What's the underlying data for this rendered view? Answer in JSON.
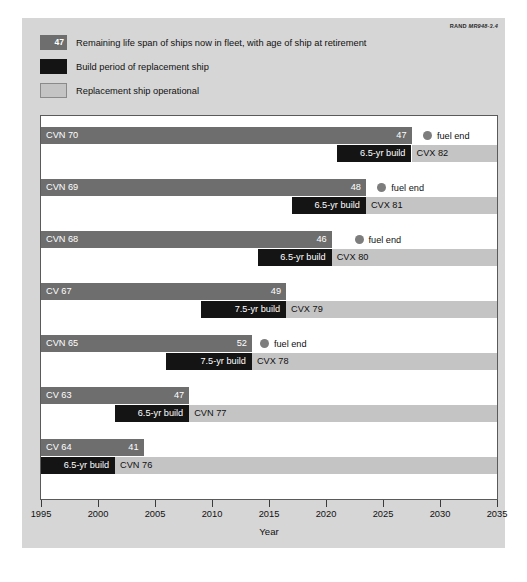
{
  "credit": {
    "org": "RAND",
    "figure_id": "MR948-3.4"
  },
  "legend": {
    "items": [
      {
        "swatch": "remaining",
        "swatch_value": "47",
        "label": "Remaining life span of ships now in fleet, with age of ship at retirement",
        "color": "#6e6e6e"
      },
      {
        "swatch": "build",
        "swatch_value": "",
        "label": "Build period of replacement ship",
        "color": "#141414"
      },
      {
        "swatch": "operational",
        "swatch_value": "",
        "label": "Replacement ship operational",
        "color": "#c4c4c4"
      }
    ]
  },
  "fuel_end_label": "fuel end",
  "chart_data": {
    "type": "bar",
    "title": "",
    "xlabel": "Year",
    "ylabel": "",
    "xlim": [
      1995,
      2035
    ],
    "xticks": [
      1995,
      2000,
      2005,
      2010,
      2015,
      2020,
      2025,
      2030,
      2035
    ],
    "grid": false,
    "legend_position": "above",
    "orientation": "horizontal",
    "categories": [
      "CVN 70",
      "CVN 69",
      "CVN 68",
      "CV 67",
      "CVN 65",
      "CV 63",
      "CV 64"
    ],
    "series": [
      {
        "name": "Remaining life span of ships now in fleet, with age of ship at retirement",
        "color": "#6e6e6e",
        "values": [
          {
            "start": 1995,
            "end": 2027.5
          },
          {
            "start": 1995,
            "end": 2023.5
          },
          {
            "start": 1995,
            "end": 2020.5
          },
          {
            "start": 1995,
            "end": 2016.5
          },
          {
            "start": 1995,
            "end": 2013.5
          },
          {
            "start": 1995,
            "end": 2008.0
          },
          {
            "start": 1995,
            "end": 2004.0
          }
        ]
      },
      {
        "name": "Build period of replacement ship",
        "color": "#141414",
        "values": [
          {
            "start": 2021.0,
            "end": 2027.5
          },
          {
            "start": 2017.0,
            "end": 2023.5
          },
          {
            "start": 2014.0,
            "end": 2020.5
          },
          {
            "start": 2009.0,
            "end": 2016.5
          },
          {
            "start": 2006.0,
            "end": 2013.5
          },
          {
            "start": 2001.5,
            "end": 2008.0
          },
          {
            "start": 1995.0,
            "end": 2001.5
          }
        ]
      },
      {
        "name": "Replacement ship operational",
        "color": "#c4c4c4",
        "values": [
          {
            "start": 2027.5,
            "end": 2035
          },
          {
            "start": 2023.5,
            "end": 2035
          },
          {
            "start": 2020.5,
            "end": 2035
          },
          {
            "start": 2016.5,
            "end": 2035
          },
          {
            "start": 2013.5,
            "end": 2035
          },
          {
            "start": 2008.0,
            "end": 2035
          },
          {
            "start": 2001.5,
            "end": 2035
          }
        ]
      }
    ],
    "rows": [
      {
        "ship": "CVN 70",
        "age_at_retirement": 47,
        "remaining_start": 1995,
        "remaining_end": 2027.5,
        "build_label": "6.5-yr build",
        "build_years": 6.5,
        "build_start": 2021.0,
        "build_end": 2027.5,
        "replacement": "CVX 82",
        "operational_start": 2027.5,
        "operational_end": 2035,
        "fuel_end": true,
        "fuel_end_year": 2028.5
      },
      {
        "ship": "CVN 69",
        "age_at_retirement": 48,
        "remaining_start": 1995,
        "remaining_end": 2023.5,
        "build_label": "6.5-yr build",
        "build_years": 6.5,
        "build_start": 2017.0,
        "build_end": 2023.5,
        "replacement": "CVX 81",
        "operational_start": 2023.5,
        "operational_end": 2035,
        "fuel_end": true,
        "fuel_end_year": 2024.5
      },
      {
        "ship": "CVN 68",
        "age_at_retirement": 46,
        "remaining_start": 1995,
        "remaining_end": 2020.5,
        "build_label": "6.5-yr build",
        "build_years": 6.5,
        "build_start": 2014.0,
        "build_end": 2020.5,
        "replacement": "CVX 80",
        "operational_start": 2020.5,
        "operational_end": 2035,
        "fuel_end": true,
        "fuel_end_year": 2022.5
      },
      {
        "ship": "CV 67",
        "age_at_retirement": 49,
        "remaining_start": 1995,
        "remaining_end": 2016.5,
        "build_label": "7.5-yr build",
        "build_years": 7.5,
        "build_start": 2009.0,
        "build_end": 2016.5,
        "replacement": "CVX 79",
        "operational_start": 2016.5,
        "operational_end": 2035,
        "fuel_end": false,
        "fuel_end_year": null
      },
      {
        "ship": "CVN 65",
        "age_at_retirement": 52,
        "remaining_start": 1995,
        "remaining_end": 2013.5,
        "build_label": "7.5-yr build",
        "build_years": 7.5,
        "build_start": 2006.0,
        "build_end": 2013.5,
        "replacement": "CVX 78",
        "operational_start": 2013.5,
        "operational_end": 2035,
        "fuel_end": true,
        "fuel_end_year": 2014.2
      },
      {
        "ship": "CV 63",
        "age_at_retirement": 47,
        "remaining_start": 1995,
        "remaining_end": 2008.0,
        "build_label": "6.5-yr build",
        "build_years": 6.5,
        "build_start": 2001.5,
        "build_end": 2008.0,
        "replacement": "CVN 77",
        "operational_start": 2008.0,
        "operational_end": 2035,
        "fuel_end": false,
        "fuel_end_year": null
      },
      {
        "ship": "CV 64",
        "age_at_retirement": 41,
        "remaining_start": 1995,
        "remaining_end": 2004.0,
        "build_label": "6.5-yr build",
        "build_years": 6.5,
        "build_start": 1995.0,
        "build_end": 2001.5,
        "replacement": "CVN 76",
        "operational_start": 2001.5,
        "operational_end": 2035,
        "fuel_end": false,
        "fuel_end_year": null
      }
    ]
  }
}
